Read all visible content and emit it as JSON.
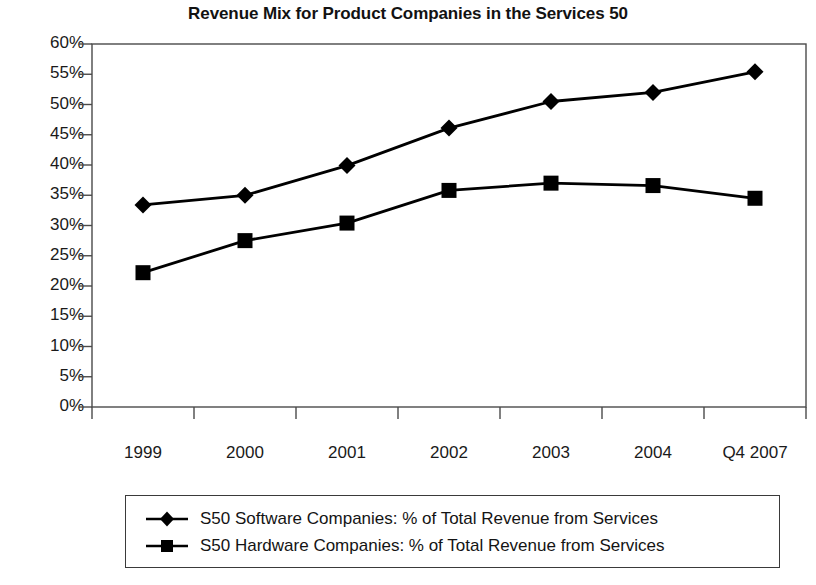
{
  "chart_data": {
    "type": "line",
    "title": "Revenue Mix for Product Companies in the Services 50",
    "xlabel": "",
    "ylabel": "",
    "categories": [
      "1999",
      "2000",
      "2001",
      "2002",
      "2003",
      "2004",
      "Q4 2007"
    ],
    "ylim": [
      0,
      60
    ],
    "ytick_step": 5,
    "ytick_labels": [
      "60%",
      "55%",
      "50%",
      "45%",
      "40%",
      "35%",
      "30%",
      "25%",
      "20%",
      "15%",
      "10%",
      "5%",
      "0%"
    ],
    "ytick_values": [
      60,
      55,
      50,
      45,
      40,
      35,
      30,
      25,
      20,
      15,
      10,
      5,
      0
    ],
    "grid": false,
    "legend_position": "bottom",
    "series": [
      {
        "name": "S50 Software Companies: % of Total Revenue from Services",
        "marker": "diamond",
        "color": "#000000",
        "values": [
          33.4,
          35.0,
          39.9,
          46.1,
          50.5,
          52.0,
          55.4
        ]
      },
      {
        "name": "S50 Hardware Companies: % of Total Revenue from Services",
        "marker": "square",
        "color": "#000000",
        "values": [
          22.2,
          27.5,
          30.4,
          35.8,
          37.0,
          36.6,
          34.5
        ]
      }
    ]
  },
  "axes": {
    "line_color": "#4a4a4a",
    "text_color": "#1a1a1a"
  }
}
